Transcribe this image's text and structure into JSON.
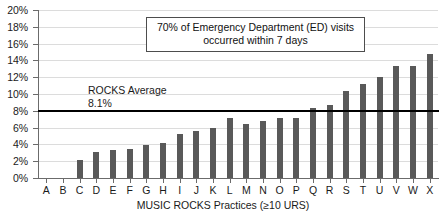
{
  "chart_data": {
    "type": "bar",
    "title": "",
    "xlabel": "MUSIC ROCKS Practices (≥10 URS)",
    "ylabel": "",
    "ylim": [
      0,
      20
    ],
    "yticks": [
      0,
      2,
      4,
      6,
      8,
      10,
      12,
      14,
      16,
      18,
      20
    ],
    "ytick_labels": [
      "0%",
      "2%",
      "4%",
      "6%",
      "8%",
      "10%",
      "12%",
      "14%",
      "16%",
      "18%",
      "20%"
    ],
    "grid": true,
    "legend": "none",
    "categories": [
      "A",
      "B",
      "C",
      "D",
      "E",
      "F",
      "G",
      "H",
      "I",
      "J",
      "K",
      "L",
      "M",
      "N",
      "O",
      "P",
      "Q",
      "R",
      "S",
      "T",
      "U",
      "V",
      "W",
      "X"
    ],
    "values": [
      0.0,
      0.0,
      2.2,
      3.1,
      3.3,
      3.4,
      3.9,
      4.2,
      5.2,
      5.6,
      6.0,
      7.1,
      6.4,
      6.8,
      7.1,
      7.2,
      8.3,
      8.7,
      10.3,
      11.2,
      12.0,
      13.3,
      13.3,
      14.8
    ],
    "bar_color": "#595959",
    "reference_line": {
      "value": 8.1,
      "label_title": "ROCKS Average",
      "label_value": "8.1%",
      "color": "#000000"
    },
    "annotations": [
      {
        "line1": "70% of Emergency Department (ED) visits",
        "line2": "occurred within 7 days"
      }
    ]
  }
}
